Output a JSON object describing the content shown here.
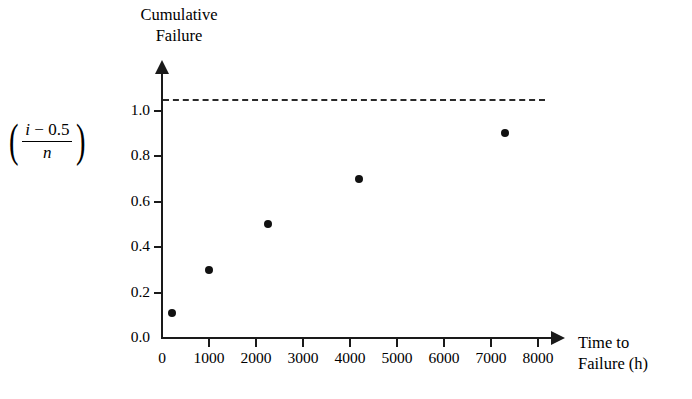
{
  "chart_data": {
    "type": "scatter",
    "title": "Cumulative\nFailure",
    "xlabel": "Time to\nFailure (h)",
    "ylabel": "(i - 0.5) / n",
    "ylabel_parts": {
      "numerator": "i − 0.5",
      "numerator_var": "i",
      "numerator_rest": " − 0.5",
      "denominator": "n",
      "left_paren": "(",
      "right_paren": ")"
    },
    "x": [
      220,
      1000,
      2250,
      4200,
      7300
    ],
    "values": [
      0.11,
      0.3,
      0.5,
      0.7,
      0.9
    ],
    "points": [
      {
        "x": 220,
        "y": 0.11
      },
      {
        "x": 1000,
        "y": 0.3
      },
      {
        "x": 2250,
        "y": 0.5
      },
      {
        "x": 4200,
        "y": 0.7
      },
      {
        "x": 7300,
        "y": 0.9
      }
    ],
    "xlim": [
      0,
      8500
    ],
    "ylim": [
      0.0,
      1.05
    ],
    "xticks": [
      0,
      1000,
      2000,
      3000,
      4000,
      5000,
      6000,
      7000,
      8000
    ],
    "xtick_labels": [
      "0",
      "1000",
      "2000",
      "3000",
      "4000",
      "5000",
      "6000",
      "7000",
      "8000"
    ],
    "yticks": [
      0.0,
      0.2,
      0.4,
      0.6,
      0.8,
      1.0
    ],
    "ytick_labels": [
      "0.0",
      "0.2",
      "0.4",
      "0.6",
      "0.8",
      "1.0"
    ],
    "grid": false,
    "legend": null,
    "annotations": [
      {
        "name": "reference-line",
        "type": "horizontal-dashed-line",
        "y": 1.0,
        "style": "dashed",
        "color": "#2a2a2a"
      }
    ],
    "marker": {
      "shape": "circle",
      "color": "#111111",
      "size": 8
    },
    "axis_style": {
      "arrow_x": true,
      "arrow_y": true,
      "color": "#1a1a1a"
    }
  },
  "colors": {
    "background": "#ffffff",
    "axis": "#1a1a1a",
    "marker": "#111111",
    "reference": "#2a2a2a",
    "text": "#000000"
  }
}
